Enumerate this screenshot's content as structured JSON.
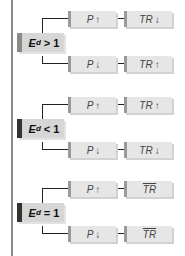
{
  "diagram": {
    "groups": [
      {
        "condition": {
          "symbol": "E",
          "subscript": "d",
          "relation": "> 1"
        },
        "condition_color": "#8a8a8a",
        "rows": [
          {
            "price": "P",
            "price_arrow": "↑",
            "revenue": "TR",
            "revenue_arrow": "↓"
          },
          {
            "price": "P",
            "price_arrow": "↓",
            "revenue": "TR",
            "revenue_arrow": "↑"
          }
        ]
      },
      {
        "condition": {
          "symbol": "E",
          "subscript": "d",
          "relation": "< 1"
        },
        "condition_color": "#333333",
        "rows": [
          {
            "price": "P",
            "price_arrow": "↑",
            "revenue": "TR",
            "revenue_arrow": "↑"
          },
          {
            "price": "P",
            "price_arrow": "↓",
            "revenue": "TR",
            "revenue_arrow": "↓"
          }
        ]
      },
      {
        "condition": {
          "symbol": "E",
          "subscript": "d",
          "relation": "= 1"
        },
        "condition_color": "#333333",
        "rows": [
          {
            "price": "P",
            "price_arrow": "↑",
            "revenue": "TR",
            "revenue_arrow": "",
            "revenue_overline": true
          },
          {
            "price": "P",
            "price_arrow": "↓",
            "revenue": "TR",
            "revenue_arrow": "",
            "revenue_overline": true
          }
        ]
      }
    ]
  }
}
